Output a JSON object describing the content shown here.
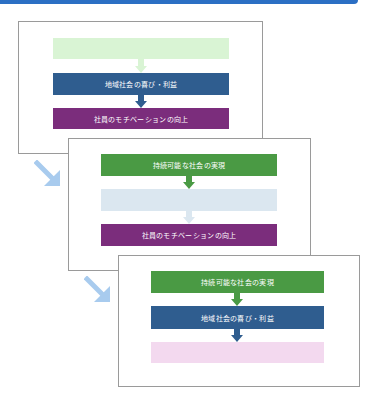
{
  "colors": {
    "green": "#4a9a44",
    "green_faded": "#d9f4d4",
    "blue": "#2f5d8f",
    "blue_faded": "#dbe7f0",
    "purple": "#7b2d7c",
    "purple_faded": "#f3d9ef",
    "diagonal_arrow": "#a8cbee",
    "top_bar": "#2b6fc4"
  },
  "labels": {
    "sustainable": "持続可能な社会の実現",
    "community": "地域社会の喜び・利益",
    "motivation": "社員のモチベーションの向上"
  },
  "slides": [
    {
      "boxes": [
        {
          "label": "",
          "state": "faded",
          "color": "green_faded"
        },
        {
          "label": "地域社会の喜び・利益",
          "state": "active",
          "color": "blue"
        },
        {
          "label": "社員のモチベーションの向上",
          "state": "active",
          "color": "purple"
        }
      ]
    },
    {
      "boxes": [
        {
          "label": "持続可能な社会の実現",
          "state": "active",
          "color": "green"
        },
        {
          "label": "",
          "state": "faded",
          "color": "blue_faded"
        },
        {
          "label": "社員のモチベーションの向上",
          "state": "active",
          "color": "purple"
        }
      ]
    },
    {
      "boxes": [
        {
          "label": "持続可能な社会の実現",
          "state": "active",
          "color": "green"
        },
        {
          "label": "地域社会の喜び・利益",
          "state": "active",
          "color": "blue"
        },
        {
          "label": "",
          "state": "faded",
          "color": "purple_faded"
        }
      ]
    }
  ]
}
